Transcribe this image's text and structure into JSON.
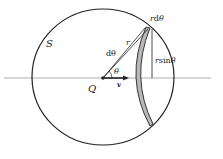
{
  "diagram": {
    "type": "geometry-physics",
    "labels": {
      "surface": "S",
      "point": "Q",
      "velocity": "v",
      "angle": "θ",
      "radius": "r",
      "d_theta": "dθ",
      "arc_length": "rdθ",
      "arc_d": "d",
      "arc_theta": "θ",
      "height_r": "r",
      "height_sin": "sin",
      "height_theta": "θ"
    },
    "colors": {
      "stroke": "#222222",
      "axis": "#888888",
      "band_fill": "#b8b8b8"
    }
  }
}
